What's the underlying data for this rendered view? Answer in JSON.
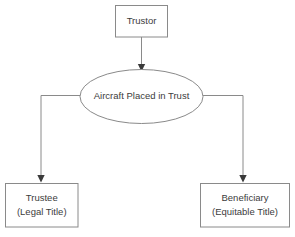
{
  "diagram": {
    "type": "flowchart",
    "colors": {
      "background": "#ffffff",
      "shape_fill": "#ffffff",
      "shape_stroke": "#8a8a8a",
      "text": "#3c3c3c",
      "arrow_fill": "#3a3a3a"
    },
    "nodes": {
      "trustor": {
        "label": "Trustor",
        "shape": "rectangle"
      },
      "trust": {
        "label": "Aircraft Placed in Trust",
        "shape": "ellipse"
      },
      "trustee": {
        "label_line1": "Trustee",
        "label_line2": "(Legal Title)",
        "shape": "rectangle"
      },
      "beneficiary": {
        "label_line1": "Beneficiary",
        "label_line2": "(Equitable Title)",
        "shape": "rectangle"
      }
    },
    "edges": [
      {
        "name": "trustor-to-trust",
        "from": "trustor",
        "to": "trust",
        "style": "straight-arrow-down"
      },
      {
        "name": "trust-to-trustee",
        "from": "trust",
        "to": "trustee",
        "style": "elbow-left-arrow-down"
      },
      {
        "name": "trust-to-beneficiary",
        "from": "trust",
        "to": "beneficiary",
        "style": "elbow-right-arrow-down"
      }
    ]
  }
}
